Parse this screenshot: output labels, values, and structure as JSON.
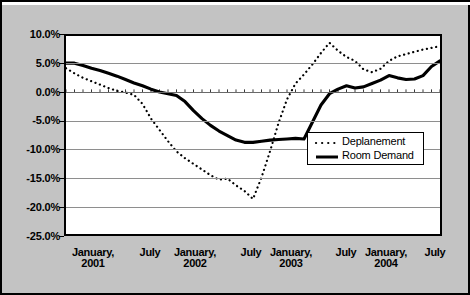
{
  "figure": {
    "background_color": "#c3c3c3",
    "plot_background_color": "#ffffff",
    "border_color": "#000000"
  },
  "legend": {
    "position": "inside-lower-right",
    "entries": [
      {
        "label": "Deplanement",
        "style": "dotted",
        "symbol": "dotted-line-swatch"
      },
      {
        "label": "Room Demand",
        "style": "solid",
        "symbol": "solid-line-swatch"
      }
    ]
  },
  "axis": {
    "y_ticks": [
      "10.0%",
      "5.0%",
      "0.0%",
      "-5.0%",
      "-10.0%",
      "-15.0%",
      "-20.0%",
      "-25.0%"
    ],
    "x_labels": [
      {
        "line1": "January,",
        "line2": "2001"
      },
      {
        "line1": "July",
        "line2": ""
      },
      {
        "line1": "January,",
        "line2": "2002"
      },
      {
        "line1": "July",
        "line2": ""
      },
      {
        "line1": "January,",
        "line2": "2003"
      },
      {
        "line1": "July",
        "line2": ""
      },
      {
        "line1": "January,",
        "line2": "2004"
      },
      {
        "line1": "July",
        "line2": ""
      }
    ]
  },
  "chart_data": {
    "type": "line",
    "title": "",
    "xlabel": "",
    "ylabel": "",
    "ylim": [
      -25.0,
      10.0
    ],
    "ytick_interval": 5.0,
    "yticks": [
      10.0,
      5.0,
      0.0,
      -5.0,
      -10.0,
      -15.0,
      -20.0,
      -25.0
    ],
    "grid": true,
    "legend_position": "inside lower right",
    "x_unit": "month",
    "x_major_labels": [
      "January, 2001",
      "July",
      "January, 2002",
      "July",
      "January, 2003",
      "July",
      "January, 2004",
      "July"
    ],
    "x": [
      "2001-01",
      "2001-02",
      "2001-03",
      "2001-04",
      "2001-05",
      "2001-06",
      "2001-07",
      "2001-08",
      "2001-09",
      "2001-10",
      "2001-11",
      "2001-12",
      "2002-01",
      "2002-02",
      "2002-03",
      "2002-04",
      "2002-05",
      "2002-06",
      "2002-07",
      "2002-08",
      "2002-09",
      "2002-10",
      "2002-11",
      "2002-12",
      "2003-01",
      "2003-02",
      "2003-03",
      "2003-04",
      "2003-05",
      "2003-06",
      "2003-07",
      "2003-08",
      "2003-09",
      "2003-10",
      "2003-11",
      "2003-12",
      "2004-01",
      "2004-02",
      "2004-03",
      "2004-04",
      "2004-05",
      "2004-06",
      "2004-07",
      "2004-08",
      "2004-09"
    ],
    "series": [
      {
        "name": "Deplanement",
        "style": "dotted",
        "color": "#000000",
        "values": [
          4.3,
          3.4,
          2.6,
          2.0,
          1.4,
          0.8,
          0.3,
          0.0,
          -0.4,
          -2.0,
          -4.6,
          -6.6,
          -8.6,
          -10.4,
          -11.6,
          -12.6,
          -13.6,
          -14.6,
          -15.4,
          -15.2,
          -16.4,
          -17.4,
          -18.8,
          -15.0,
          -10.4,
          -5.4,
          -1.2,
          1.6,
          3.2,
          5.0,
          7.0,
          8.8,
          7.4,
          6.3,
          5.6,
          4.1,
          3.6,
          4.2,
          5.6,
          6.4,
          6.8,
          7.2,
          7.6,
          7.9,
          8.2
        ]
      },
      {
        "name": "Room Demand",
        "style": "solid",
        "color": "#000000",
        "values": [
          5.2,
          5.2,
          4.8,
          4.3,
          3.9,
          3.4,
          2.9,
          2.3,
          1.7,
          1.2,
          0.6,
          0.1,
          -0.2,
          -0.5,
          -1.6,
          -3.2,
          -4.6,
          -5.8,
          -6.8,
          -7.6,
          -8.4,
          -8.8,
          -8.8,
          -8.6,
          -8.4,
          -8.3,
          -8.2,
          -8.1,
          -8.2,
          -5.2,
          -2.2,
          -0.2,
          0.6,
          1.2,
          0.8,
          1.0,
          1.6,
          2.2,
          3.0,
          2.6,
          2.3,
          2.4,
          3.0,
          4.6,
          5.6
        ]
      }
    ]
  }
}
